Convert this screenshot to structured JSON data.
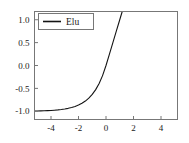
{
  "chart_data": {
    "type": "line",
    "title": "",
    "xlabel": "",
    "ylabel": "",
    "xlim": [
      -5.2,
      5.2
    ],
    "ylim": [
      -1.18,
      1.18
    ],
    "grid": false,
    "legend_position": "upper left",
    "xticks": [
      "-4",
      "-2",
      "0",
      "2",
      "4"
    ],
    "xtick_values": [
      -4,
      -2,
      0,
      2,
      4
    ],
    "yticks": [
      "1.0",
      "0.5",
      "0.0",
      "-0.5",
      "-1.0"
    ],
    "ytick_values": [
      1.0,
      0.5,
      0.0,
      -0.5,
      -1.0
    ],
    "series": [
      {
        "name": "Elu",
        "color": "#141414",
        "x": [
          -5.2,
          -5.0,
          -4.75,
          -4.5,
          -4.25,
          -4.0,
          -3.75,
          -3.5,
          -3.25,
          -3.0,
          -2.75,
          -2.5,
          -2.25,
          -2.0,
          -1.75,
          -1.5,
          -1.25,
          -1.0,
          -0.75,
          -0.5,
          -0.25,
          0.0,
          0.25,
          0.5,
          0.75,
          1.0,
          1.18
        ],
        "y": [
          -0.9945,
          -0.9933,
          -0.9913,
          -0.9889,
          -0.9857,
          -0.9817,
          -0.9765,
          -0.9698,
          -0.9612,
          -0.9502,
          -0.9361,
          -0.9179,
          -0.8946,
          -0.8647,
          -0.8262,
          -0.7769,
          -0.7135,
          -0.6321,
          -0.5276,
          -0.3935,
          -0.2212,
          0.0,
          0.25,
          0.5,
          0.75,
          1.0,
          1.18
        ]
      }
    ],
    "legend": [
      {
        "label": "Elu",
        "color": "#141414"
      }
    ]
  }
}
